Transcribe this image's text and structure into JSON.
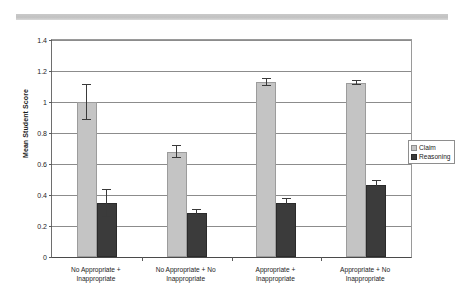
{
  "decor": {
    "scan_strip_color": "#c6c6c6"
  },
  "chart_data": {
    "type": "bar",
    "title": "",
    "subtitle": "",
    "xlabel": "",
    "ylabel": "Mean Student Score",
    "ylim": [
      0,
      1.4
    ],
    "ytick_step": 0.2,
    "ytick_labels": [
      "0",
      "0.2",
      "0.4",
      "0.6",
      "0.8",
      "1",
      "1.2",
      "1.4"
    ],
    "ytick_values": [
      0,
      0.2,
      0.4,
      0.6,
      0.8,
      1.0,
      1.2,
      1.4
    ],
    "grid": true,
    "grid_axis": "y",
    "legend_position": "right",
    "error_bars": "symmetric",
    "categories": [
      "No Appropriate +\nInappropriate",
      "No Appropriate + No\nInappropriate",
      "Appropriate +\nInappropriate",
      "Appropriate + No\nInappropriate"
    ],
    "series": [
      {
        "name": "Claim",
        "color": "#c4c4c4",
        "values": [
          1.0,
          0.68,
          1.13,
          1.125
        ],
        "errors": [
          0.115,
          0.04,
          0.025,
          0.015
        ]
      },
      {
        "name": "Reasoning",
        "color": "#3b3b3b",
        "values": [
          0.35,
          0.285,
          0.35,
          0.465
        ],
        "errors": [
          0.09,
          0.025,
          0.03,
          0.03
        ]
      }
    ]
  }
}
